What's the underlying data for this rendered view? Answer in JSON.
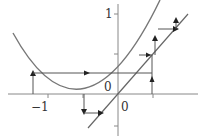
{
  "diagram": {
    "function": "y = x^2 + x",
    "diagonal": "y = x",
    "colors": {
      "axis": "#888888",
      "curve": "#777777",
      "path": "#555555",
      "arrow": "#222222",
      "text": "#333333"
    },
    "origin_px": [
      118,
      94
    ],
    "scale_px": {
      "x": 70,
      "y": 80
    },
    "labels": {
      "y_tick_1": "1",
      "x_tick_neg1": "−1",
      "origin_upper": "0",
      "origin_lower": "0"
    },
    "axes": {
      "x_range": [
        -1.6,
        1.15
      ],
      "y_range": [
        -0.55,
        1.15
      ],
      "x_ticks": [
        -1,
        0.5
      ],
      "y_ticks": [
        1,
        0.5,
        -0.5
      ]
    }
  }
}
